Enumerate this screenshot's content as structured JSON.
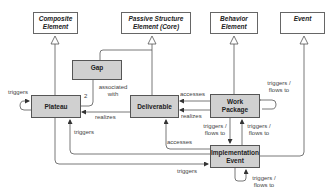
{
  "diagram": {
    "abstract_elements": {
      "composite": "Composite Element",
      "passive": "Passive Structure Element (Core)",
      "behavior": "Behavior Element",
      "event": "Event"
    },
    "concrete_elements": {
      "gap": "Gap",
      "plateau": "Plateau",
      "deliverable": "Deliverable",
      "work_package": "Work Package",
      "implementation_event": "Implementation Event"
    },
    "relationship_labels": {
      "plateau_self_triggers": "triggers",
      "gap_multiplicity": "2",
      "gap_associated_with": "associated with",
      "deliverable_realizes_plateau": "realizes",
      "wp_accesses_deliverable": "accesses",
      "wp_realizes_deliverable": "realizes",
      "wp_self_triggers": "triggers / flows to",
      "wp_to_event": "triggers / flows to",
      "event_to_wp": "triggers / flows to",
      "event_accesses_deliverable": "accesses",
      "event_triggers_plateau": "triggers",
      "plateau_triggers_event": "triggers",
      "event_self_triggers": "triggers / flows to"
    },
    "colors": {
      "abstract_fill": "#ffffff",
      "concrete_fill": "#d0d0d0",
      "line": "#555555"
    }
  }
}
